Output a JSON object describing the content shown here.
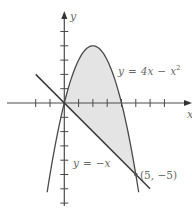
{
  "figure": {
    "y_axis_label": "y",
    "x_axis_label": "x",
    "curve_label": {
      "lhs": "y",
      "eq": "=",
      "rhs1": "4x",
      "op": "−",
      "rhs2": "x",
      "exp": "2"
    },
    "line_label": {
      "lhs": "y",
      "eq": "=",
      "rhs": "−x"
    },
    "point_label": "(5, −5)",
    "colors": {
      "stroke": "#4a4a4a",
      "fill": "#e4e4e4",
      "text": "#6a6a6a"
    }
  },
  "chart_data": {
    "type": "line",
    "title": "",
    "xlabel": "x",
    "ylabel": "y",
    "series": [
      {
        "name": "y = 4x - x^2",
        "function": "4x - x^2",
        "x_range": [
          -1.2,
          5.2
        ]
      },
      {
        "name": "y = -x",
        "function": "-x",
        "x_range": [
          -2,
          6
        ]
      }
    ],
    "shaded_region": {
      "between": [
        "y = 4x - x^2",
        "y = -x"
      ],
      "x_range": [
        0,
        5
      ]
    },
    "intersections": [
      [
        0,
        0
      ],
      [
        5,
        -5
      ]
    ],
    "annotations": [
      "y = 4x - x^2",
      "y = -x",
      "(5, -5)"
    ],
    "x_ticks": [
      -2,
      -1,
      1,
      2,
      3,
      4,
      5,
      6,
      7
    ],
    "y_ticks": [
      -7,
      -6,
      -5,
      -4,
      -3,
      -2,
      -1,
      1,
      2,
      3,
      4,
      5
    ],
    "xlim": [
      -4,
      9
    ],
    "ylim": [
      -7,
      6.3
    ],
    "grid": false
  }
}
